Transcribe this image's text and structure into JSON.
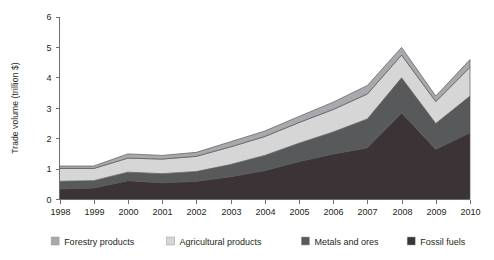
{
  "chart_data": {
    "type": "area",
    "stacked": true,
    "title": "",
    "subtitle": "",
    "xlabel": "",
    "ylabel": "Trade volume (trillion $)",
    "categories": [
      "1998",
      "1999",
      "2000",
      "2001",
      "2002",
      "2003",
      "2004",
      "2005",
      "2006",
      "2007",
      "2008",
      "2009",
      "2010"
    ],
    "xlim": [
      1998,
      2010
    ],
    "ylim": [
      0,
      6
    ],
    "yticks": [
      "0",
      "1",
      "2",
      "3",
      "4",
      "5",
      "6"
    ],
    "ytick_values": [
      0,
      1,
      2,
      3,
      4,
      5,
      6
    ],
    "grid": false,
    "legend_position": "bottom",
    "stack_order_bottom_to_top": [
      "Fossil fuels",
      "Metals and ores",
      "Agricultural products",
      "Forestry products"
    ],
    "series": [
      {
        "name": "Fossil fuels",
        "color": "#3b3335",
        "values": [
          0.35,
          0.38,
          0.62,
          0.55,
          0.6,
          0.75,
          0.95,
          1.25,
          1.5,
          1.7,
          2.85,
          1.65,
          2.2
        ]
      },
      {
        "name": "Metals and ores",
        "color": "#58595b",
        "values": [
          0.25,
          0.24,
          0.28,
          0.3,
          0.32,
          0.4,
          0.5,
          0.6,
          0.72,
          0.95,
          1.15,
          0.85,
          1.2
        ]
      },
      {
        "name": "Agricultural products",
        "color": "#d6d6d6",
        "values": [
          0.42,
          0.4,
          0.46,
          0.48,
          0.5,
          0.58,
          0.62,
          0.68,
          0.74,
          0.82,
          0.75,
          0.72,
          0.95
        ]
      },
      {
        "name": "Forestry products",
        "color": "#a7a9ac",
        "values": [
          0.08,
          0.08,
          0.14,
          0.12,
          0.13,
          0.17,
          0.18,
          0.2,
          0.24,
          0.28,
          0.25,
          0.18,
          0.25
        ]
      }
    ],
    "totals": [
      1.1,
      1.1,
      1.5,
      1.45,
      1.55,
      1.9,
      2.25,
      2.73,
      3.2,
      3.75,
      5.0,
      3.4,
      4.6
    ],
    "annotations": []
  },
  "legend": {
    "items": [
      {
        "label": "Forestry products",
        "color": "#a7a9ac"
      },
      {
        "label": "Agricultural products",
        "color": "#d6d6d6"
      },
      {
        "label": "Metals and ores",
        "color": "#58595b"
      },
      {
        "label": "Fossil fuels",
        "color": "#3b3335"
      }
    ]
  }
}
